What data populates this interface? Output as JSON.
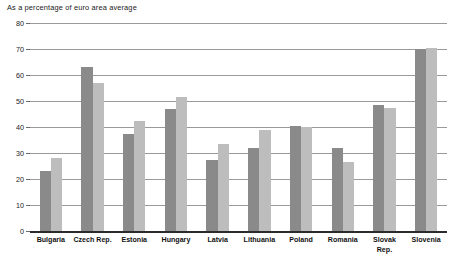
{
  "chart_data": {
    "type": "bar",
    "title": "As a percentage of euro area average",
    "xlabel": "",
    "ylabel": "",
    "ylim": [
      0,
      80
    ],
    "yticks": [
      0,
      10,
      20,
      30,
      40,
      50,
      60,
      70,
      80
    ],
    "grid": true,
    "legend": "none",
    "categories": [
      "Bulgaria",
      "Czech Rep.",
      "Estonia",
      "Hungary",
      "Latvia",
      "Lithuania",
      "Poland",
      "Romania",
      "Slovak\nRep.",
      "Slovenia"
    ],
    "series": [
      {
        "name": "series-1",
        "color": "#8a8a8a",
        "values": [
          23,
          63,
          37.5,
          47,
          27.5,
          32,
          40.5,
          32,
          48.5,
          70
        ]
      },
      {
        "name": "series-2",
        "color": "#bdbdbd",
        "values": [
          28,
          57,
          42.5,
          51.5,
          33.5,
          39,
          40,
          26.5,
          47.5,
          70.5
        ]
      }
    ]
  },
  "colors": {
    "series_dark": "#8a8a8a",
    "series_light": "#bdbdbd",
    "gridline": "#9a9a9a",
    "axis": "#2b2b2b",
    "text": "#1a1a1a",
    "background": "#ffffff"
  }
}
